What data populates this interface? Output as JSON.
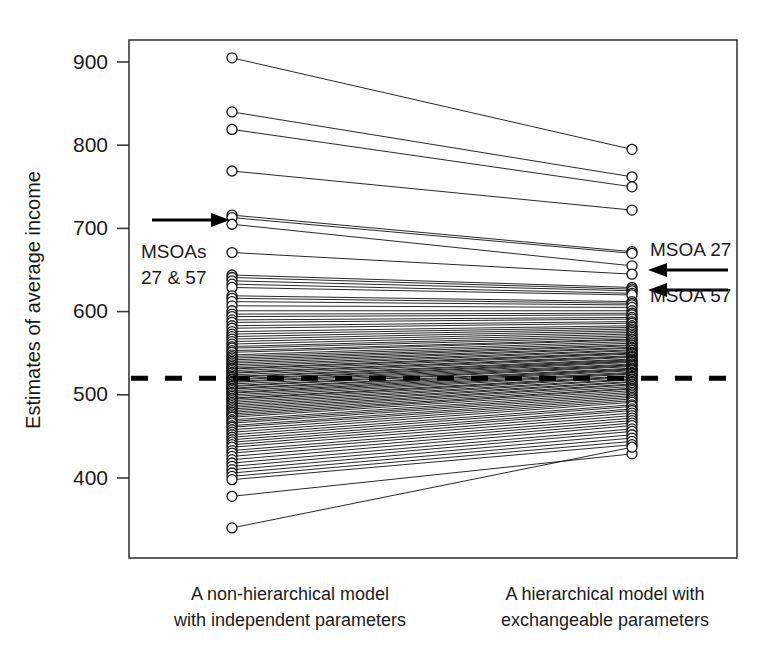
{
  "chart_data": {
    "type": "line",
    "title": "",
    "subtitle": "",
    "xlabel": "",
    "ylabel": "Estimates of average income",
    "categories": [
      "A non-hierarchical model with independent parameters",
      "A hierarchical model with exchangeable parameters"
    ],
    "x_tick_labels": [
      "A non-hierarchical model\nwith independent parameters",
      "A hierarchical model with\nexchangeable parameters"
    ],
    "y_tick_labels": [
      "400",
      "500",
      "600",
      "700",
      "800",
      "900"
    ],
    "y_ticks": [
      400,
      500,
      600,
      700,
      800,
      900
    ],
    "ylim": [
      325,
      925
    ],
    "grid": false,
    "legend": "none",
    "reference_line": {
      "label": "",
      "value": 520,
      "style": "dashed",
      "color": "#000000"
    },
    "annotations": [
      {
        "name": "left-annotation",
        "text_lines": [
          "MSOAs",
          "27 & 57"
        ],
        "arrow": "right",
        "points_to": [
          713,
          705
        ]
      },
      {
        "name": "right-annotation-27",
        "text": "MSOA 27",
        "arrow": "left",
        "points_to": 672
      },
      {
        "name": "right-annotation-57",
        "text": "MSOA 57",
        "arrow": "left",
        "points_to": 655
      }
    ],
    "series_note": "Each line links one MSOA's non-hierarchical estimate (left) to its hierarchical/shrunken estimate (right).",
    "pairs": [
      [
        905,
        795
      ],
      [
        840,
        762
      ],
      [
        819,
        750
      ],
      [
        769,
        722
      ],
      [
        716,
        672
      ],
      [
        713,
        670
      ],
      [
        705,
        655
      ],
      [
        671,
        645
      ],
      [
        644,
        629
      ],
      [
        641,
        627
      ],
      [
        637,
        625
      ],
      [
        633,
        622
      ],
      [
        629,
        620
      ],
      [
        619,
        612
      ],
      [
        616,
        610
      ],
      [
        612,
        608
      ],
      [
        607,
        605
      ],
      [
        601,
        601
      ],
      [
        597,
        598
      ],
      [
        594,
        596
      ],
      [
        590,
        593
      ],
      [
        587,
        591
      ],
      [
        583,
        588
      ],
      [
        580,
        586
      ],
      [
        576,
        583
      ],
      [
        573,
        581
      ],
      [
        570,
        579
      ],
      [
        567,
        577
      ],
      [
        564,
        575
      ],
      [
        561,
        573
      ],
      [
        558,
        571
      ],
      [
        556,
        569
      ],
      [
        553,
        567
      ],
      [
        551,
        566
      ],
      [
        548,
        564
      ],
      [
        546,
        562
      ],
      [
        544,
        560
      ],
      [
        542,
        559
      ],
      [
        540,
        557
      ],
      [
        538,
        556
      ],
      [
        536,
        554
      ],
      [
        534,
        553
      ],
      [
        532,
        551
      ],
      [
        531,
        550
      ],
      [
        529,
        549
      ],
      [
        527,
        547
      ],
      [
        526,
        546
      ],
      [
        524,
        545
      ],
      [
        522,
        543
      ],
      [
        521,
        542
      ],
      [
        519,
        541
      ],
      [
        518,
        540
      ],
      [
        516,
        539
      ],
      [
        515,
        537
      ],
      [
        513,
        536
      ],
      [
        511,
        535
      ],
      [
        510,
        534
      ],
      [
        508,
        532
      ],
      [
        507,
        531
      ],
      [
        505,
        530
      ],
      [
        503,
        529
      ],
      [
        502,
        527
      ],
      [
        500,
        526
      ],
      [
        498,
        525
      ],
      [
        496,
        523
      ],
      [
        495,
        522
      ],
      [
        493,
        521
      ],
      [
        491,
        519
      ],
      [
        489,
        518
      ],
      [
        487,
        516
      ],
      [
        485,
        515
      ],
      [
        483,
        513
      ],
      [
        481,
        512
      ],
      [
        479,
        510
      ],
      [
        477,
        508
      ],
      [
        475,
        507
      ],
      [
        473,
        505
      ],
      [
        470,
        503
      ],
      [
        468,
        501
      ],
      [
        466,
        499
      ],
      [
        463,
        497
      ],
      [
        461,
        495
      ],
      [
        458,
        493
      ],
      [
        455,
        491
      ],
      [
        452,
        488
      ],
      [
        449,
        486
      ],
      [
        446,
        483
      ],
      [
        443,
        481
      ],
      [
        440,
        478
      ],
      [
        437,
        475
      ],
      [
        433,
        472
      ],
      [
        430,
        469
      ],
      [
        426,
        466
      ],
      [
        422,
        463
      ],
      [
        418,
        459
      ],
      [
        414,
        456
      ],
      [
        410,
        452
      ],
      [
        406,
        448
      ],
      [
        402,
        444
      ],
      [
        398,
        440
      ],
      [
        378,
        429
      ],
      [
        340,
        437
      ]
    ]
  },
  "axis": {
    "y_label": "Estimates of average income",
    "ticks": [
      {
        "value": 900,
        "label": "900"
      },
      {
        "value": 800,
        "label": "800"
      },
      {
        "value": 700,
        "label": "700"
      },
      {
        "value": 600,
        "label": "600"
      },
      {
        "value": 500,
        "label": "500"
      },
      {
        "value": 400,
        "label": "400"
      }
    ]
  },
  "captions": {
    "left_line1": "A non-hierarchical model",
    "left_line2": "with independent parameters",
    "right_line1": "A hierarchical model with",
    "right_line2": "exchangeable parameters"
  },
  "annotations": {
    "left_line1": "MSOAs",
    "left_line2": "27 & 57",
    "right_top": "MSOA 27",
    "right_bottom": "MSOA 57"
  },
  "colors": {
    "background": "#ffffff",
    "ink": "#111111",
    "frame": "#3a3a3a",
    "reference_line": "#000000"
  }
}
